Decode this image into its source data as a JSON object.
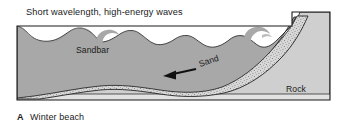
{
  "figure": {
    "title": "Short wavelength, high-energy waves",
    "caption_letter": "A",
    "caption_text": "Winter beach",
    "labels": {
      "sandbar": "Sandbar",
      "sand": "Sand",
      "rock": "Rock"
    },
    "colors": {
      "background": "#ffffff",
      "water": "#a8a8a8",
      "rock": "#cfcfcf",
      "sand_fill": "#d8d8d8",
      "bedrock": "#e2e2e2",
      "outline": "#1a1a1a",
      "text": "#1a1a1a",
      "stipple": "#6b6b6b"
    }
  }
}
